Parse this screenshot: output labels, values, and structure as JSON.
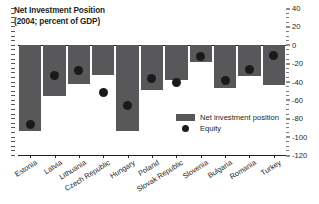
{
  "chart_data": {
    "type": "bar",
    "title": "Net Investment Position",
    "subtitle": "(2004; percent of GDP)",
    "xlabel": "",
    "ylabel": "",
    "ylim": [
      -120,
      40
    ],
    "yticks": [
      40,
      20,
      0,
      -20,
      -40,
      -60,
      -80,
      -100,
      -120
    ],
    "ytick_labels": [
      "40",
      "20",
      "0",
      "-20",
      "-40",
      "-60",
      "-80",
      "-100",
      "-120"
    ],
    "grid": false,
    "legend_position": "inside-right-lower",
    "categories": [
      "Estonia",
      "Latvia",
      "Lithuania",
      "Czech Republic",
      "Hungary",
      "Poland",
      "Slovak Republic",
      "Slovenia",
      "Bulgaria",
      "Romania",
      "Turkey"
    ],
    "series": [
      {
        "name": "Net investment position",
        "type": "bar",
        "color": "#58585a",
        "values": [
          -94,
          -55,
          -42,
          -33,
          -94,
          -49,
          -38,
          -19,
          -47,
          -34,
          -44
        ]
      },
      {
        "name": "Equity",
        "type": "scatter",
        "color": "#1a1a1a",
        "values": [
          -86,
          -33,
          -28,
          -52,
          -66,
          -36,
          -41,
          -12,
          -39,
          -27,
          -11
        ]
      }
    ]
  },
  "legend": {
    "items": [
      {
        "label": "Net investment position"
      },
      {
        "label": "Equity"
      }
    ]
  },
  "colors": {
    "bar": "#58585a",
    "dot": "#1a1a1a",
    "axis": "#231f20",
    "background": "#ffffff"
  }
}
